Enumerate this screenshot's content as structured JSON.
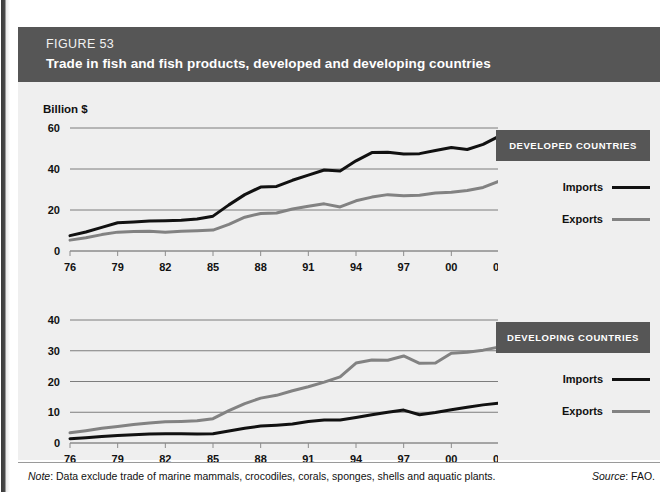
{
  "header": {
    "figure_number": "FIGURE 53",
    "title": "Trade in fish and fish products, developed and developing countries"
  },
  "unit_label": "Billion $",
  "footer": {
    "note_word": "Note",
    "note_text": ": Data exclude trade of marine mammals, crocodiles, corals, sponges, shells and aquatic plants.",
    "source_word": "Source",
    "source_text": ": FAO."
  },
  "legends": {
    "developed": {
      "title": "DEVELOPED COUNTRIES",
      "imports_label": "Imports",
      "exports_label": "Exports"
    },
    "developing": {
      "title": "DEVELOPING COUNTRIES",
      "imports_label": "Imports",
      "exports_label": "Exports"
    }
  },
  "colors": {
    "imports_line": "#111111",
    "exports_line": "#828282",
    "header_bar": "#565656",
    "panel_background": "#efefef",
    "gridline": "#7d7d7d"
  },
  "chart_data": [
    {
      "type": "line",
      "title": "Trade in fish and fish products, developed countries",
      "xlabel": "",
      "ylabel": "Billion $",
      "ylim": [
        0,
        60
      ],
      "yticks": [
        0,
        20,
        40,
        60
      ],
      "ytick_labels": [
        "0",
        "20",
        "40",
        "60"
      ],
      "xlim": [
        1976,
        2003
      ],
      "xticks": [
        1976,
        1979,
        1982,
        1985,
        1988,
        1991,
        1994,
        1997,
        2000,
        2003
      ],
      "xtick_labels": [
        "76",
        "79",
        "82",
        "85",
        "88",
        "91",
        "94",
        "97",
        "00",
        "03"
      ],
      "grid": true,
      "legend_position": "right",
      "x": [
        1976,
        1977,
        1978,
        1979,
        1980,
        1981,
        1982,
        1983,
        1984,
        1985,
        1986,
        1987,
        1988,
        1989,
        1990,
        1991,
        1992,
        1993,
        1994,
        1995,
        1996,
        1997,
        1998,
        1999,
        2000,
        2001,
        2002,
        2003
      ],
      "series": [
        {
          "name": "Imports",
          "color": "#111111",
          "values": [
            7.5,
            9.3,
            11.5,
            13.8,
            14.2,
            14.6,
            14.8,
            15.0,
            15.6,
            17.0,
            22.5,
            27.5,
            31.2,
            31.5,
            34.5,
            37.0,
            39.5,
            39.0,
            44.0,
            48.0,
            48.2,
            47.3,
            47.5,
            49.0,
            50.5,
            49.5,
            52.0,
            56.0
          ]
        },
        {
          "name": "Exports",
          "color": "#828282",
          "values": [
            5.3,
            6.5,
            8.0,
            9.2,
            9.5,
            9.6,
            9.2,
            9.6,
            9.9,
            10.2,
            13.0,
            16.5,
            18.3,
            18.5,
            20.5,
            21.8,
            23.0,
            21.5,
            24.5,
            26.3,
            27.5,
            27.0,
            27.2,
            28.3,
            28.7,
            29.5,
            31.0,
            34.0
          ]
        }
      ]
    },
    {
      "type": "line",
      "title": "Trade in fish and fish products, developing countries",
      "xlabel": "",
      "ylabel": "Billion $",
      "ylim": [
        0,
        40
      ],
      "yticks": [
        0,
        10,
        20,
        30,
        40
      ],
      "ytick_labels": [
        "0",
        "10",
        "20",
        "30",
        "40"
      ],
      "xlim": [
        1976,
        2003
      ],
      "xticks": [
        1976,
        1979,
        1982,
        1985,
        1988,
        1991,
        1994,
        1997,
        2000,
        2003
      ],
      "xtick_labels": [
        "76",
        "79",
        "82",
        "85",
        "88",
        "91",
        "94",
        "97",
        "00",
        "03"
      ],
      "grid": true,
      "legend_position": "right",
      "x": [
        1976,
        1977,
        1978,
        1979,
        1980,
        1981,
        1982,
        1983,
        1984,
        1985,
        1986,
        1987,
        1988,
        1989,
        1990,
        1991,
        1992,
        1993,
        1994,
        1995,
        1996,
        1997,
        1998,
        1999,
        2000,
        2001,
        2002,
        2003
      ],
      "series": [
        {
          "name": "Imports",
          "color": "#111111",
          "values": [
            1.4,
            1.7,
            2.1,
            2.4,
            2.7,
            2.9,
            3.0,
            3.0,
            2.9,
            3.0,
            3.9,
            4.8,
            5.5,
            5.8,
            6.2,
            7.0,
            7.5,
            7.5,
            8.3,
            9.2,
            10.0,
            10.7,
            9.2,
            9.9,
            10.8,
            11.6,
            12.4,
            13.0
          ]
        },
        {
          "name": "Exports",
          "color": "#828282",
          "values": [
            3.3,
            4.0,
            4.8,
            5.4,
            6.0,
            6.5,
            6.9,
            7.0,
            7.2,
            7.9,
            10.5,
            12.8,
            14.6,
            15.5,
            17.0,
            18.3,
            19.8,
            21.5,
            26.0,
            27.0,
            26.9,
            28.3,
            25.9,
            26.0,
            29.2,
            29.5,
            30.2,
            31.2
          ]
        }
      ]
    }
  ]
}
